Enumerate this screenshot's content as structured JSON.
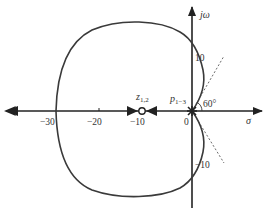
{
  "diagram": {
    "type": "root-locus",
    "axes": {
      "x_label": "σ",
      "y_label": "jω",
      "x_ticks": [
        {
          "value": -30,
          "label": "−30"
        },
        {
          "value": -20,
          "label": "−20"
        },
        {
          "value": -10,
          "label": "−10"
        },
        {
          "value": 0,
          "label": "0"
        }
      ],
      "y_ticks": [
        {
          "value": 10,
          "label": "10"
        },
        {
          "value": -10,
          "label": "−10"
        }
      ]
    },
    "zero_label": {
      "main": "z",
      "sub": "1,2"
    },
    "pole_label": {
      "main": "p",
      "sub": "1−3"
    },
    "angle_label": "60°",
    "zero_location": -10,
    "pole_location": 0,
    "asymptote_angle_deg": 60,
    "colors": {
      "locus": "#3a3a3a",
      "axis": "#222222",
      "asymptote": "#444444",
      "text": "#333333"
    }
  }
}
